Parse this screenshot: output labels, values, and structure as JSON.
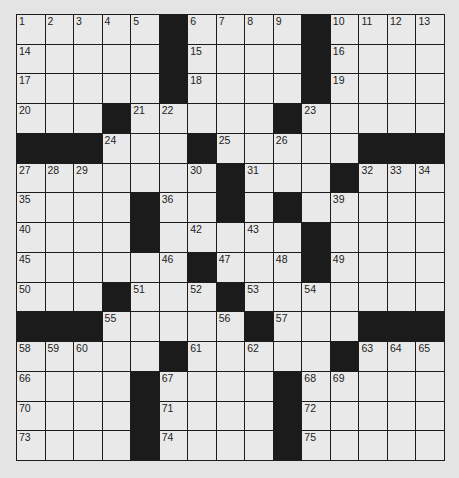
{
  "puzzle": {
    "rows": 15,
    "cols": 15,
    "layout": [
      "#####.####.####",
      "#####.####.####",
      "#####.####.####",
      "###.#####.#####",
      "...###.#####...",
      "#######.###.###",
      "####.##.#.#####",
      "####.#####.####",
      "######.###.####",
      "###.###.#######",
      "...#####.###...",
      "#####.#####.###",
      "####.####.#####",
      "####.####.#####",
      "####.####.#####"
    ],
    "numbers": [
      [
        1,
        2,
        3,
        4,
        5,
        0,
        6,
        7,
        8,
        9,
        0,
        10,
        11,
        12,
        13
      ],
      [
        14,
        0,
        0,
        0,
        0,
        0,
        15,
        0,
        0,
        0,
        0,
        16,
        0,
        0,
        0
      ],
      [
        17,
        0,
        0,
        0,
        0,
        0,
        18,
        0,
        0,
        0,
        0,
        19,
        0,
        0,
        0
      ],
      [
        20,
        0,
        0,
        0,
        21,
        22,
        0,
        0,
        0,
        0,
        23,
        0,
        0,
        0,
        0
      ],
      [
        0,
        0,
        0,
        24,
        0,
        0,
        0,
        25,
        0,
        26,
        0,
        0,
        0,
        0,
        0
      ],
      [
        27,
        28,
        29,
        0,
        0,
        0,
        30,
        0,
        31,
        0,
        0,
        0,
        32,
        33,
        34
      ],
      [
        35,
        0,
        0,
        0,
        0,
        36,
        0,
        37,
        0,
        38,
        0,
        39,
        0,
        0,
        0
      ],
      [
        40,
        0,
        0,
        0,
        41,
        0,
        42,
        0,
        43,
        0,
        44,
        0,
        0,
        0,
        0
      ],
      [
        45,
        0,
        0,
        0,
        0,
        46,
        0,
        47,
        0,
        48,
        0,
        49,
        0,
        0,
        0
      ],
      [
        50,
        0,
        0,
        0,
        51,
        0,
        52,
        0,
        53,
        0,
        54,
        0,
        0,
        0,
        0
      ],
      [
        0,
        0,
        0,
        55,
        0,
        0,
        0,
        56,
        0,
        57,
        0,
        0,
        0,
        0,
        0
      ],
      [
        58,
        59,
        60,
        0,
        0,
        0,
        61,
        0,
        62,
        0,
        0,
        0,
        63,
        64,
        65
      ],
      [
        66,
        0,
        0,
        0,
        0,
        67,
        0,
        0,
        0,
        0,
        68,
        69,
        0,
        0,
        0
      ],
      [
        70,
        0,
        0,
        0,
        0,
        71,
        0,
        0,
        0,
        0,
        72,
        0,
        0,
        0,
        0
      ],
      [
        73,
        0,
        0,
        0,
        0,
        74,
        0,
        0,
        0,
        0,
        75,
        0,
        0,
        0,
        0
      ]
    ],
    "legend": {
      "white": "#",
      "black": "."
    },
    "colors": {
      "background": "#e4e4e4",
      "cell": "#e9e9e9",
      "block": "#1b1b1b",
      "line": "#1c1c1c"
    }
  }
}
